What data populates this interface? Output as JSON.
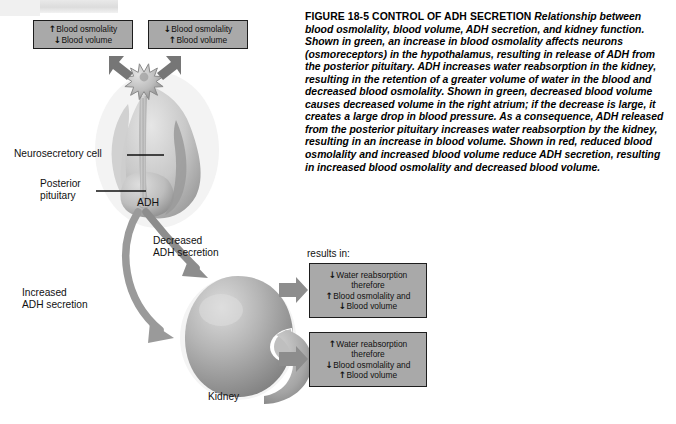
{
  "figure": {
    "caption": {
      "heading": "FIGURE 18-5 CONTROL OF ADH SECRETION",
      "body": "Relationship between blood osmolality, blood volume, ADH secretion, and kidney function. Shown in green, an increase in blood osmolality affects neurons (osmoreceptors) in the hypothalamus, resulting in release of ADH from the posterior pituitary. ADH increases water reabsorption in the kidney, resulting in the retention of a greater volume of water in the blood and decreased blood osmolality. Shown in green, decreased blood volume causes decreased volume in the right atrium; if the decrease is large, it creates a large drop in blood pressure. As a consequence, ADH released from the posterior pituitary increases water reabsorption by the kidney, resulting in an increase in blood volume. Shown in red, reduced blood osmolality and increased blood volume reduce ADH secretion, resulting in increased blood osmolality and decreased blood volume."
    },
    "stimulus_boxes": [
      {
        "id": "increased-osmolality",
        "lines": [
          {
            "arrow": "↑",
            "text": "Blood osmolality"
          },
          {
            "arrow": "↓",
            "text": "Blood volume"
          }
        ]
      },
      {
        "id": "decreased-osmolality",
        "lines": [
          {
            "arrow": "↓",
            "text": "Blood osmolality"
          },
          {
            "arrow": "↑",
            "text": "Blood volume"
          }
        ]
      }
    ],
    "anatomy_labels": {
      "neurosecretory_cell": "Neurosecretory cell",
      "posterior_pituitary_line1": "Posterior",
      "posterior_pituitary_line2": "pituitary",
      "adh": "ADH",
      "kidney": "Kidney"
    },
    "secretion_labels": {
      "decreased_line1": "Decreased",
      "decreased_line2": "ADH secretion",
      "increased_line1": "Increased",
      "increased_line2": "ADH secretion"
    },
    "results_header": "results in:",
    "result_boxes": [
      {
        "id": "result-decreased-adh",
        "lines": [
          {
            "arrow": "↓",
            "text": "Water reabsorption"
          },
          {
            "arrow": "",
            "text": "therefore"
          },
          {
            "arrow": "↑",
            "text": "Blood osmolality and"
          },
          {
            "arrow": "↓",
            "text": "Blood volume"
          }
        ]
      },
      {
        "id": "result-increased-adh",
        "lines": [
          {
            "arrow": "↑",
            "text": "Water reabsorption"
          },
          {
            "arrow": "",
            "text": "therefore"
          },
          {
            "arrow": "↓",
            "text": "Blood osmolality and"
          },
          {
            "arrow": "↑",
            "text": "Blood volume"
          }
        ]
      }
    ],
    "colors": {
      "box_fill": "#a9a9a9",
      "box_border": "#1d1d1d",
      "arrow_grey": "#8d8d8d",
      "arrow_dark": "#6f6f6f",
      "tissue_light": "#d7d7d7",
      "tissue_mid": "#b9b9b9",
      "tissue_dark": "#8f8f8f",
      "page_background": "#ffffff"
    }
  }
}
